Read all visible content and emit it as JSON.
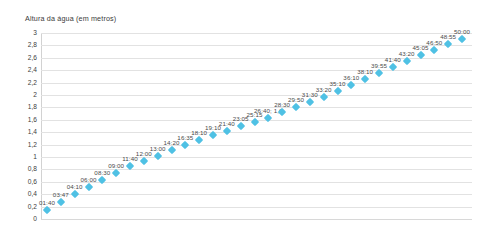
{
  "chart_data": {
    "type": "scatter",
    "title": "Altura da água (em metros)",
    "xlabel": "",
    "ylabel": "",
    "ylim": [
      0,
      3
    ],
    "ytick_step": 0.2,
    "grid": true,
    "legend": "none",
    "marker": {
      "shape": "diamond",
      "color": "#4fc1e4",
      "size": 6
    },
    "decimal_separator": ",",
    "ytick_labels": [
      "3",
      "2,8",
      "2,6",
      "2,4",
      "2,2",
      "2",
      "1,8",
      "1,6",
      "1,4",
      "1,2",
      "1",
      "0,8",
      "0,6",
      "0,4",
      "0,2",
      "0"
    ],
    "ytick_values": [
      3,
      2.8,
      2.6,
      2.4,
      2.2,
      2,
      1.8,
      1.6,
      1.4,
      1.2,
      1,
      0.8,
      0.6,
      0.4,
      0.2,
      0
    ],
    "point_label_field": "time",
    "points": [
      {
        "time": "01:40",
        "x": 1,
        "y": 0.15,
        "label": "01:40"
      },
      {
        "time": "03:47",
        "x": 2,
        "y": 0.28,
        "label": "03:47"
      },
      {
        "time": "04:10",
        "x": 3,
        "y": 0.4,
        "label": "04:10"
      },
      {
        "time": "06:00",
        "x": 4,
        "y": 0.52,
        "label": "06:00"
      },
      {
        "time": "08:30",
        "x": 5,
        "y": 0.63,
        "label": "08:30"
      },
      {
        "time": "09:00",
        "x": 6,
        "y": 0.74,
        "label": "09:00"
      },
      {
        "time": "11:40",
        "x": 7,
        "y": 0.86,
        "label": "11:40"
      },
      {
        "time": "12:00",
        "x": 8,
        "y": 0.94,
        "label": "12:00"
      },
      {
        "time": "13:00",
        "x": 9,
        "y": 1.02,
        "label": "13:00"
      },
      {
        "time": "14:20",
        "x": 10,
        "y": 1.12,
        "label": "14:20"
      },
      {
        "time": "16:35",
        "x": 11,
        "y": 1.19,
        "label": "16:35"
      },
      {
        "time": "18:10",
        "x": 12,
        "y": 1.28,
        "label": "18:10"
      },
      {
        "time": "19:10",
        "x": 13,
        "y": 1.36,
        "label": "19:10"
      },
      {
        "time": "21:40",
        "x": 14,
        "y": 1.42,
        "label": "21:40"
      },
      {
        "time": "23:05",
        "x": 15,
        "y": 1.5,
        "label": "23:05"
      },
      {
        "time": "25:15",
        "x": 16,
        "y": 1.56,
        "label": "25:15"
      },
      {
        "time": "26:40",
        "x": 17,
        "y": 1.63,
        "label": "26:40; 1,6",
        "value": 1.6
      },
      {
        "time": "28:30",
        "x": 18,
        "y": 1.72,
        "label": "28:30"
      },
      {
        "time": "29:50",
        "x": 19,
        "y": 1.8,
        "label": "29:50"
      },
      {
        "time": "31:30",
        "x": 20,
        "y": 1.88,
        "label": "31:30"
      },
      {
        "time": "33:20",
        "x": 21,
        "y": 1.97,
        "label": "33:20"
      },
      {
        "time": "35:10",
        "x": 22,
        "y": 2.06,
        "label": "35:10"
      },
      {
        "time": "36:10",
        "x": 23,
        "y": 2.16,
        "label": "36:10"
      },
      {
        "time": "38:10",
        "x": 24,
        "y": 2.26,
        "label": "38:10"
      },
      {
        "time": "39:55",
        "x": 25,
        "y": 2.36,
        "label": "39:55"
      },
      {
        "time": "41:40",
        "x": 26,
        "y": 2.45,
        "label": "41:40"
      },
      {
        "time": "43:20",
        "x": 27,
        "y": 2.55,
        "label": "43:20"
      },
      {
        "time": "45:05",
        "x": 28,
        "y": 2.64,
        "label": "45:05"
      },
      {
        "time": "46:50",
        "x": 29,
        "y": 2.73,
        "label": "46:50"
      },
      {
        "time": "48:55",
        "x": 30,
        "y": 2.82,
        "label": "48:55"
      },
      {
        "time": "50:00",
        "x": 31,
        "y": 2.9,
        "label": "50:00"
      }
    ]
  }
}
